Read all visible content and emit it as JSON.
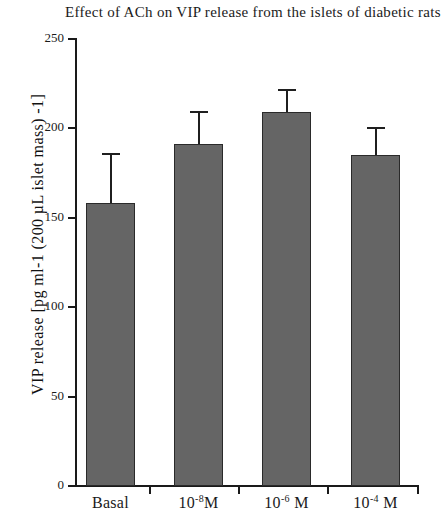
{
  "chart_data": {
    "type": "bar",
    "title": "Effect of ACh on VIP release from the islets of diabetic rats",
    "xlabel": "",
    "ylabel": "VIP release [pg ml-1 (200 µL islet mass) -1]",
    "categories": [
      "Basal",
      "10-8M",
      "10-6 M",
      "10-4 M"
    ],
    "category_labels_html": [
      "Basal",
      "10⁻⁸M",
      "10⁻⁶ M",
      "10⁻⁴ M"
    ],
    "values": [
      158,
      191,
      209,
      185
    ],
    "errors": [
      28,
      19,
      13,
      16
    ],
    "ylim": [
      0,
      250
    ],
    "yticks": [
      0,
      50,
      100,
      150,
      200,
      250
    ],
    "ytick_labels": [
      "0",
      "50",
      "100",
      "150",
      "200",
      "250"
    ],
    "grid": false,
    "legend": null,
    "bar_color": "#656565",
    "bar_edge_color": "#2a2a2a",
    "axis_color": "#1a1a1a",
    "error_bar_style": "upper-only-cap"
  }
}
